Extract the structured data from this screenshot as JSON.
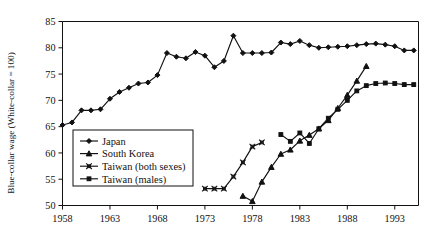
{
  "chart_data": {
    "type": "line",
    "title": "",
    "xlabel": "",
    "ylabel": "Blue-collar wage (White-collar = 100)",
    "xlim": [
      1958,
      1995.5
    ],
    "ylim": [
      50,
      85
    ],
    "grid": false,
    "legend_position": "inner-left",
    "xticks": [
      1958,
      1963,
      1968,
      1973,
      1978,
      1983,
      1988,
      1993
    ],
    "xtick_labels": [
      "1958",
      "1963",
      "1968",
      "1973",
      "1978",
      "1983",
      "1988",
      "1993"
    ],
    "yticks": [
      50,
      55,
      60,
      65,
      70,
      75,
      80,
      85
    ],
    "ytick_labels": [
      "50",
      "55",
      "60",
      "65",
      "70",
      "75",
      "80",
      "85"
    ],
    "series": [
      {
        "name": "Japan",
        "marker": "diamond",
        "x": [
          1958,
          1959,
          1960,
          1961,
          1962,
          1963,
          1964,
          1965,
          1966,
          1967,
          1968,
          1969,
          1970,
          1971,
          1972,
          1973,
          1974,
          1975,
          1976,
          1977,
          1978,
          1979,
          1980,
          1981,
          1982,
          1983,
          1984,
          1985,
          1986,
          1987,
          1988,
          1989,
          1990,
          1991,
          1992,
          1993,
          1994,
          1995
        ],
        "values": [
          65.3,
          65.8,
          68.1,
          68.1,
          68.3,
          70.3,
          71.6,
          72.4,
          73.2,
          73.4,
          74.8,
          79.0,
          78.3,
          78.0,
          79.2,
          78.5,
          76.3,
          77.5,
          82.3,
          79.0,
          79.0,
          79.0,
          79.1,
          81.0,
          80.7,
          81.3,
          80.5,
          80.0,
          80.1,
          80.2,
          80.3,
          80.5,
          80.7,
          80.8,
          80.6,
          80.3,
          79.5,
          79.5
        ]
      },
      {
        "name": "South Korea",
        "marker": "triangle",
        "x": [
          1977,
          1978,
          1979,
          1980,
          1981,
          1982,
          1983,
          1984,
          1985,
          1986,
          1987,
          1988,
          1989,
          1990
        ],
        "values": [
          51.8,
          50.8,
          54.5,
          57.3,
          59.8,
          60.6,
          62.3,
          63.4,
          64.6,
          66.2,
          68.5,
          71.0,
          73.7,
          76.5
        ]
      },
      {
        "name": "Taiwan (both sexes)",
        "marker": "x-square",
        "x": [
          1973,
          1974,
          1975,
          1976,
          1977,
          1978,
          1979
        ],
        "values": [
          53.2,
          53.2,
          53.2,
          55.5,
          58.2,
          61.2,
          62.0
        ]
      },
      {
        "name": "Taiwan (males)",
        "marker": "square",
        "x": [
          1981,
          1982,
          1983,
          1984,
          1985,
          1986,
          1987,
          1988,
          1989,
          1990,
          1991,
          1992,
          1993,
          1994,
          1995
        ],
        "values": [
          63.5,
          62.2,
          63.8,
          61.8,
          64.6,
          66.6,
          68.3,
          70.0,
          71.8,
          72.8,
          73.2,
          73.3,
          73.2,
          73.0,
          73.0
        ]
      }
    ]
  },
  "legend": {
    "items": [
      {
        "label": "Japan"
      },
      {
        "label": "South Korea"
      },
      {
        "label": "Taiwan (both sexes)"
      },
      {
        "label": "Taiwan (males)"
      }
    ]
  }
}
